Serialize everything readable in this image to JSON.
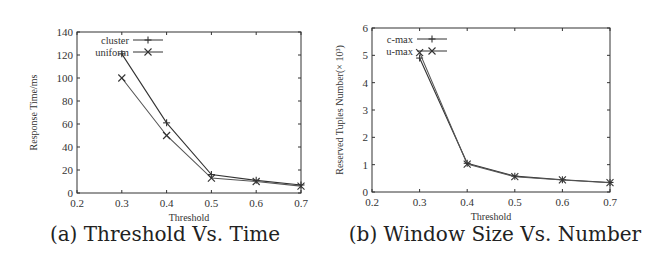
{
  "chart_data": [
    {
      "type": "line",
      "caption": "(a) Threshold Vs. Time",
      "title": "",
      "xlabel": "Threshold",
      "ylabel": "Response Time/ms",
      "xlim": [
        0.2,
        0.7
      ],
      "ylim": [
        0,
        140
      ],
      "xticks": [
        "0.2",
        "0.3",
        "0.4",
        "0.5",
        "0.6",
        "0.7"
      ],
      "yticks": [
        "0",
        "20",
        "40",
        "60",
        "80",
        "100",
        "120",
        "140"
      ],
      "grid": false,
      "legend_position": "top-left",
      "x": [
        0.3,
        0.4,
        0.5,
        0.6,
        0.7
      ],
      "series": [
        {
          "name": "cluster",
          "marker": "plus",
          "values": [
            121,
            61,
            16,
            11,
            7
          ]
        },
        {
          "name": "uniform",
          "marker": "cross",
          "values": [
            100,
            50,
            13,
            10,
            6
          ]
        }
      ]
    },
    {
      "type": "line",
      "caption": "(b) Window Size Vs. Number",
      "title": "",
      "xlabel": "Threshold",
      "ylabel": "Reserved Tuples Number(× 10³)",
      "xlim": [
        0.2,
        0.7
      ],
      "ylim": [
        0,
        6
      ],
      "xticks": [
        "0.2",
        "0.3",
        "0.4",
        "0.5",
        "0.6",
        "0.7"
      ],
      "yticks": [
        "0",
        "1",
        "2",
        "3",
        "4",
        "5",
        "6"
      ],
      "grid": false,
      "legend_position": "top-left",
      "x": [
        0.3,
        0.4,
        0.5,
        0.6,
        0.7
      ],
      "series": [
        {
          "name": "c-max",
          "marker": "plus",
          "values": [
            4.9,
            1.05,
            0.58,
            0.45,
            0.35
          ]
        },
        {
          "name": "u-max",
          "marker": "cross",
          "values": [
            5.1,
            1.02,
            0.56,
            0.44,
            0.34
          ]
        }
      ]
    }
  ]
}
